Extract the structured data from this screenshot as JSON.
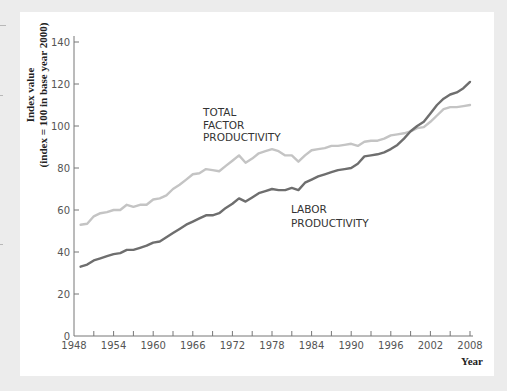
{
  "chart_data": {
    "type": "line",
    "title": "",
    "xlabel": "Year",
    "ylabel": "Index value (index = 100 in base year 2000)",
    "ylabel_lines": [
      "Index value",
      "(index = 100 in base year 2000)"
    ],
    "xlim": [
      1948,
      2008
    ],
    "ylim": [
      0,
      140
    ],
    "x_ticks": [
      1948,
      1954,
      1960,
      1966,
      1972,
      1978,
      1984,
      1990,
      1996,
      2002,
      2008
    ],
    "x_minor_step": 3,
    "y_ticks": [
      0,
      20,
      40,
      60,
      80,
      100,
      120,
      140
    ],
    "grid": false,
    "legend": "inline labels",
    "x": [
      1949,
      1950,
      1951,
      1952,
      1953,
      1954,
      1955,
      1956,
      1957,
      1958,
      1959,
      1960,
      1961,
      1962,
      1963,
      1964,
      1965,
      1966,
      1967,
      1968,
      1969,
      1970,
      1971,
      1972,
      1973,
      1974,
      1975,
      1976,
      1977,
      1978,
      1979,
      1980,
      1981,
      1982,
      1983,
      1984,
      1985,
      1986,
      1987,
      1988,
      1989,
      1990,
      1991,
      1992,
      1993,
      1994,
      1995,
      1996,
      1997,
      1998,
      1999,
      2000,
      2001,
      2002,
      2003,
      2004,
      2005,
      2006,
      2007,
      2008
    ],
    "series": [
      {
        "name": "Total Factor Productivity",
        "label_lines": [
          "TOTAL",
          "FACTOR",
          "PRODUCTIVITY"
        ],
        "color": "#c4c4c4",
        "values": [
          53,
          53.5,
          57,
          58.5,
          59,
          60,
          60,
          62.5,
          61.5,
          62.5,
          62.5,
          65,
          65.5,
          67,
          70,
          72,
          74.5,
          77,
          77.5,
          79.5,
          79,
          78.5,
          81,
          83.5,
          86,
          82.5,
          84.5,
          87,
          88,
          89,
          88,
          86,
          86,
          83,
          86,
          88.5,
          89,
          89.5,
          90.5,
          90.5,
          91,
          91.5,
          90.5,
          92.5,
          93,
          93,
          94,
          95.5,
          96,
          96.5,
          97.5,
          99,
          99.5,
          102,
          105,
          108,
          109,
          109,
          109.5,
          110
        ]
      },
      {
        "name": "Labor Productivity",
        "label_lines": [
          "LABOR",
          "PRODUCTIVITY"
        ],
        "color": "#6e6e6e",
        "values": [
          33,
          34,
          36,
          37,
          38,
          39,
          39.5,
          41,
          41,
          42,
          43,
          44.5,
          45,
          47,
          49,
          51,
          53,
          54.5,
          56,
          57.5,
          57.5,
          58.5,
          61,
          63,
          65.5,
          64,
          66,
          68,
          69,
          70,
          69.5,
          69.5,
          70.5,
          69.5,
          73,
          74.5,
          76,
          77,
          78,
          79,
          79.5,
          80,
          82,
          85.5,
          86,
          86.5,
          87.5,
          89,
          91,
          94,
          97.5,
          100,
          102,
          106,
          110,
          113,
          115,
          116,
          118,
          121
        ]
      }
    ]
  }
}
